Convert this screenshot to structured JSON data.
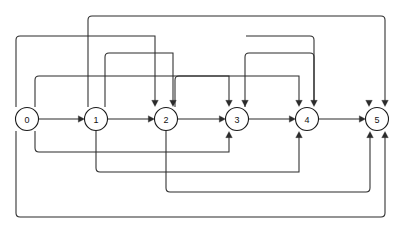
{
  "diagram": {
    "corner_note": "",
    "stroke_color": "#2b2b2b",
    "node_fill": "#ffffff",
    "node_stroke": "#1a1a1a",
    "background": "#ffffff",
    "width": 399,
    "height": 233,
    "node_radius": 11.5,
    "baseline_y": 119,
    "nodes": [
      {
        "id": "0",
        "label": "0",
        "cx": 27,
        "cy": 119
      },
      {
        "id": "1",
        "label": "1",
        "cx": 96,
        "cy": 119
      },
      {
        "id": "2",
        "label": "2",
        "cx": 166,
        "cy": 119
      },
      {
        "id": "3",
        "label": "3",
        "cx": 237,
        "cy": 119
      },
      {
        "id": "4",
        "label": "4",
        "cx": 307,
        "cy": 119
      },
      {
        "id": "5",
        "label": "5",
        "cx": 377,
        "cy": 119
      }
    ],
    "edges": [
      {
        "name": "edge-0-1",
        "from": "0",
        "to": "1",
        "route": "direct",
        "d": "M 38.5 119 L 79 119",
        "arrow": {
          "x": 84.5,
          "y": 119,
          "dir": "right"
        }
      },
      {
        "name": "edge-1-2",
        "from": "1",
        "to": "2",
        "route": "direct",
        "d": "M 107.5 119 L 149 119",
        "arrow": {
          "x": 154.5,
          "y": 119,
          "dir": "right"
        }
      },
      {
        "name": "edge-2-3",
        "from": "2",
        "to": "3",
        "route": "direct",
        "d": "M 177.5 119 L 220 119",
        "arrow": {
          "x": 225.5,
          "y": 119,
          "dir": "right"
        }
      },
      {
        "name": "edge-3-4",
        "from": "3",
        "to": "4",
        "route": "direct",
        "d": "M 248.5 119 L 290 119",
        "arrow": {
          "x": 295.5,
          "y": 119,
          "dir": "right"
        }
      },
      {
        "name": "edge-4-5",
        "from": "4",
        "to": "5",
        "route": "direct",
        "d": "M 318.5 119 L 360 119",
        "arrow": {
          "x": 365.5,
          "y": 119,
          "dir": "right"
        }
      },
      {
        "name": "edge-0-2-top",
        "from": "0",
        "to": "2",
        "route": "over",
        "d": "M 16 107 L 16 40 Q 16 36 20 36 L 155 36 L 155 101",
        "arrow": {
          "x": 155,
          "y": 106.5,
          "dir": "down"
        }
      },
      {
        "name": "edge-1-3-top",
        "from": "1",
        "to": "3",
        "route": "over",
        "d": "M 88 107 L 88 20 Q 88 16 92 16 L 381 16 Q 385 16 385 20 L 385 101",
        "arrow": {
          "x": 385,
          "y": 106.5,
          "dir": "down"
        }
      },
      {
        "name": "edge-1-2-top",
        "from": "1",
        "to": "2",
        "route": "over",
        "d": "M 105 107 L 105 57 Q 105 53 109 53 L 173 53 L 173 101",
        "arrow": {
          "x": 173,
          "y": 106.5,
          "dir": "down"
        }
      },
      {
        "name": "edge-0-3-top",
        "from": "0",
        "to": "3",
        "route": "over",
        "d": "M 35 107 L 35 80 Q 35 76 39 76 L 229 76 L 229 101",
        "arrow": {
          "x": 229,
          "y": 106.5,
          "dir": "down"
        }
      },
      {
        "name": "edge-2-4-top",
        "from": "2",
        "to": "4",
        "route": "over",
        "d": "M 175 107 L 175 80 Q 175 76 179 76 L 299 76 L 299 101",
        "arrow": {
          "x": 299,
          "y": 106.5,
          "dir": "down"
        }
      },
      {
        "name": "edge-2-5-top",
        "from": "2",
        "to": "5",
        "route": "over",
        "d": "M 245 107 L 245 57 Q 245 53 249 53 L 310 53 Q 314 53 314 57 L 314 101",
        "arrow": {
          "x": 314,
          "y": 106.5,
          "dir": "down"
        }
      },
      {
        "name": "edge-3-5-top",
        "from": "3",
        "to": "5",
        "route": "over",
        "d": "M 246 36 L 310 36 Q 314 36 314 40 L 314 101",
        "arrow": {
          "x": 369,
          "y": 106.5,
          "dir": "down"
        }
      },
      {
        "name": "edge-0-3-bottom",
        "from": "0",
        "to": "3",
        "route": "under",
        "d": "M 35 131 L 35 148 Q 35 152 39 152 L 229 152 L 229 137",
        "arrow": {
          "x": 229,
          "y": 131.5,
          "dir": "up"
        }
      },
      {
        "name": "edge-1-4-bottom",
        "from": "1",
        "to": "4",
        "route": "under",
        "d": "M 96 131 L 96 168 Q 96 172 100 172 L 299 172 L 299 137",
        "arrow": {
          "x": 299,
          "y": 131.5,
          "dir": "up"
        }
      },
      {
        "name": "edge-2-5-bottom",
        "from": "2",
        "to": "5",
        "route": "under",
        "d": "M 166 131 L 166 188 Q 166 192 170 192 L 366 192 Q 370 192 370 188 L 370 137",
        "arrow": {
          "x": 370,
          "y": 131.5,
          "dir": "up"
        }
      },
      {
        "name": "edge-0-5-bottom",
        "from": "0",
        "to": "5",
        "route": "under",
        "d": "M 16 131 L 16 213 Q 16 217 20 217 L 381 217 Q 385 217 385 213 L 385 137",
        "arrow": {
          "x": 385,
          "y": 131.5,
          "dir": "up"
        }
      }
    ],
    "arrowheads": [
      {
        "name": "arrow-into-1",
        "x": 84.5,
        "y": 119,
        "dir": "right"
      },
      {
        "name": "arrow-into-2",
        "x": 154.5,
        "y": 119,
        "dir": "right"
      },
      {
        "name": "arrow-into-3",
        "x": 225.5,
        "y": 119,
        "dir": "right"
      },
      {
        "name": "arrow-into-4",
        "x": 295.5,
        "y": 119,
        "dir": "right"
      },
      {
        "name": "arrow-into-5",
        "x": 365.5,
        "y": 119,
        "dir": "right"
      },
      {
        "name": "arrow-top-2-a",
        "x": 155,
        "y": 106.5,
        "dir": "down"
      },
      {
        "name": "arrow-top-2-b",
        "x": 173,
        "y": 106.5,
        "dir": "down"
      },
      {
        "name": "arrow-top-3-a",
        "x": 229,
        "y": 106.5,
        "dir": "down"
      },
      {
        "name": "arrow-top-3-b",
        "x": 245,
        "y": 106.5,
        "dir": "down"
      },
      {
        "name": "arrow-top-4-a",
        "x": 299,
        "y": 106.5,
        "dir": "down"
      },
      {
        "name": "arrow-top-4-b",
        "x": 314,
        "y": 106.5,
        "dir": "down"
      },
      {
        "name": "arrow-top-5-a",
        "x": 369,
        "y": 106.5,
        "dir": "down"
      },
      {
        "name": "arrow-top-5-b",
        "x": 385,
        "y": 106.5,
        "dir": "down"
      },
      {
        "name": "arrow-bottom-3",
        "x": 229,
        "y": 131.5,
        "dir": "up"
      },
      {
        "name": "arrow-bottom-4",
        "x": 299,
        "y": 131.5,
        "dir": "up"
      },
      {
        "name": "arrow-bottom-5-a",
        "x": 370,
        "y": 131.5,
        "dir": "up"
      },
      {
        "name": "arrow-bottom-5-b",
        "x": 385,
        "y": 131.5,
        "dir": "up"
      }
    ]
  }
}
